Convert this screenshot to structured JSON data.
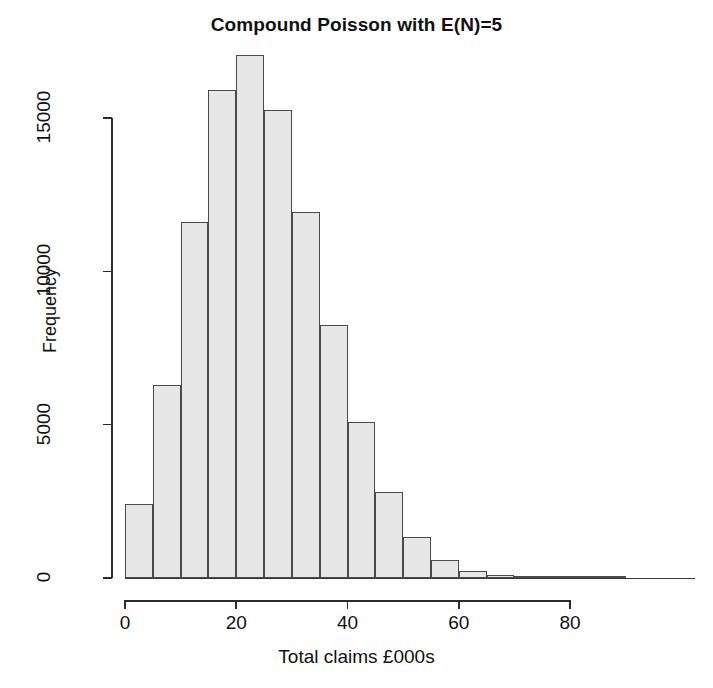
{
  "chart_data": {
    "type": "bar",
    "title": "Compound Poisson with E(N)=5",
    "xlabel": "Total claims £000s",
    "ylabel": "Frequency",
    "xlim": [
      0,
      91
    ],
    "ylim": [
      0,
      17500
    ],
    "grid": false,
    "legend": null,
    "bin_width": 5,
    "bin_edges": [
      0,
      5,
      10,
      15,
      20,
      25,
      30,
      35,
      40,
      45,
      50,
      55,
      60,
      65,
      70,
      75,
      80,
      85,
      90
    ],
    "categories": [
      "0-5",
      "5-10",
      "10-15",
      "15-20",
      "20-25",
      "25-30",
      "30-35",
      "35-40",
      "40-45",
      "45-50",
      "50-55",
      "55-60",
      "60-65",
      "65-70",
      "70-75",
      "75-80",
      "80-85",
      "85-90"
    ],
    "values": [
      2420,
      6300,
      11620,
      15900,
      17050,
      15250,
      11950,
      8250,
      5100,
      2790,
      1350,
      600,
      240,
      95,
      40,
      15,
      5,
      2
    ],
    "xticks": [
      0,
      20,
      40,
      60,
      80
    ],
    "xtick_labels": [
      "0",
      "20",
      "40",
      "60",
      "80"
    ],
    "yticks": [
      0,
      5000,
      10000,
      15000
    ],
    "ytick_labels": [
      "0",
      "5000",
      "10000",
      "15000"
    ],
    "bar_fill_color": "#e7e7e7",
    "bar_edge_color": "#4a4a4a",
    "axis_color": "#2b2b2b",
    "background_color": "#ffffff"
  }
}
